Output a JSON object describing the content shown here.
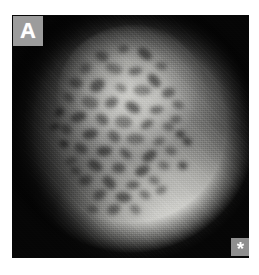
{
  "figure": {
    "domain": "medical-endoscopy-photograph",
    "modality": "magnifying chromoendoscopy",
    "panel_label": "A",
    "marker_symbol": "*",
    "marker_name": "asterisk-marker",
    "colorspace": "grayscale",
    "page_background": "#ffffff",
    "image_frame": {
      "x": 12,
      "y": 15,
      "width": 237,
      "height": 243,
      "background": "#070707"
    },
    "panel_label_box": {
      "background": "#9c9c9c",
      "text_color": "#ffffff",
      "x": 13,
      "y": 16,
      "width": 30,
      "height": 30
    },
    "marker_box": {
      "background": "#8f8f8f",
      "text_color": "#ffffff",
      "x": 231,
      "y": 238,
      "width": 19,
      "height": 18
    },
    "regions": [
      {
        "name": "illuminated-field-of-view",
        "description": "circular endoscope light field centered upper-left of middle",
        "center_pct": [
          52,
          44
        ],
        "luminance": "mid-gray"
      },
      {
        "name": "central-lesion",
        "description": "brighter plateau with dark pit-pattern crypt openings",
        "center_pct": [
          45,
          33
        ],
        "luminance": "light-gray"
      },
      {
        "name": "mucosal-fold",
        "description": "bright smooth fold sweeping across lower-right",
        "center_pct": [
          74,
          90
        ],
        "luminance": "bright"
      },
      {
        "name": "vignette-shadow",
        "description": "dark occluded corners outside the circular field",
        "luminance": "near-black"
      }
    ],
    "pit_pattern": {
      "description": "irregular dark crypt openings over the lesion surface",
      "count": 58,
      "fill": "#4a4a4a",
      "spots": [
        [
          38,
          17,
          7,
          5,
          22
        ],
        [
          47,
          14,
          6,
          4,
          -14
        ],
        [
          56,
          16,
          8,
          5,
          36
        ],
        [
          63,
          21,
          6,
          4,
          8
        ],
        [
          31,
          22,
          6,
          5,
          -28
        ],
        [
          43,
          22,
          9,
          5,
          18
        ],
        [
          52,
          23,
          7,
          4,
          -8
        ],
        [
          60,
          27,
          8,
          5,
          48
        ],
        [
          27,
          28,
          7,
          5,
          14
        ],
        [
          36,
          29,
          8,
          6,
          -36
        ],
        [
          46,
          30,
          6,
          4,
          26
        ],
        [
          55,
          31,
          9,
          5,
          4
        ],
        [
          66,
          32,
          7,
          5,
          -18
        ],
        [
          24,
          34,
          6,
          4,
          40
        ],
        [
          33,
          36,
          9,
          6,
          12
        ],
        [
          42,
          36,
          7,
          5,
          -24
        ],
        [
          51,
          38,
          8,
          5,
          30
        ],
        [
          61,
          39,
          7,
          4,
          -6
        ],
        [
          70,
          37,
          6,
          4,
          20
        ],
        [
          28,
          42,
          8,
          5,
          -16
        ],
        [
          38,
          43,
          7,
          5,
          34
        ],
        [
          47,
          44,
          9,
          6,
          6
        ],
        [
          57,
          45,
          7,
          4,
          -30
        ],
        [
          66,
          46,
          6,
          4,
          16
        ],
        [
          23,
          47,
          6,
          5,
          28
        ],
        [
          33,
          49,
          8,
          5,
          -12
        ],
        [
          43,
          50,
          7,
          5,
          42
        ],
        [
          52,
          51,
          9,
          5,
          2
        ],
        [
          62,
          52,
          6,
          4,
          -22
        ],
        [
          71,
          49,
          5,
          4,
          10
        ],
        [
          29,
          55,
          7,
          5,
          24
        ],
        [
          39,
          56,
          8,
          5,
          -8
        ],
        [
          48,
          57,
          7,
          4,
          38
        ],
        [
          58,
          58,
          8,
          5,
          -34
        ],
        [
          67,
          56,
          6,
          4,
          14
        ],
        [
          25,
          60,
          6,
          4,
          -20
        ],
        [
          35,
          62,
          8,
          5,
          32
        ],
        [
          45,
          63,
          7,
          5,
          0
        ],
        [
          55,
          64,
          8,
          5,
          -26
        ],
        [
          64,
          62,
          6,
          4,
          18
        ],
        [
          31,
          68,
          7,
          5,
          -10
        ],
        [
          41,
          69,
          8,
          5,
          44
        ],
        [
          51,
          70,
          7,
          4,
          -4
        ],
        [
          60,
          68,
          6,
          4,
          22
        ],
        [
          37,
          74,
          7,
          5,
          -32
        ],
        [
          47,
          75,
          8,
          5,
          8
        ],
        [
          56,
          74,
          6,
          4,
          28
        ],
        [
          43,
          80,
          7,
          5,
          -18
        ],
        [
          52,
          80,
          6,
          4,
          36
        ],
        [
          34,
          80,
          6,
          4,
          6
        ],
        [
          69,
          43,
          6,
          4,
          -14
        ],
        [
          74,
          52,
          5,
          4,
          24
        ],
        [
          20,
          40,
          5,
          4,
          -40
        ],
        [
          22,
          53,
          5,
          4,
          18
        ],
        [
          63,
          72,
          6,
          4,
          -24
        ],
        [
          27,
          64,
          6,
          4,
          30
        ],
        [
          72,
          62,
          5,
          4,
          12
        ],
        [
          18,
          46,
          5,
          3,
          -8
        ]
      ]
    }
  }
}
